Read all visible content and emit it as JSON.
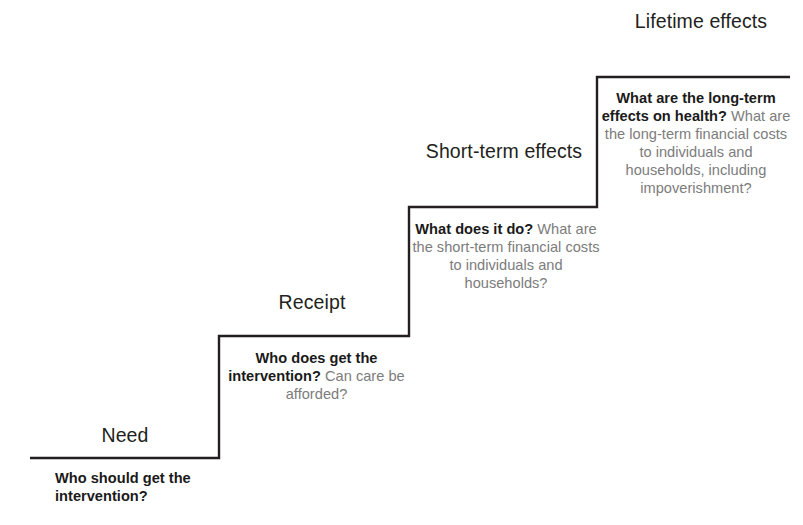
{
  "diagram": {
    "line_color": "#231f20",
    "primary_text_color": "#1a1a1a",
    "secondary_text_color": "#7c7c7c",
    "background_color": "#ffffff"
  },
  "steps": [
    {
      "id": "need",
      "heading": "Need",
      "primary_question": "Who should get the intervention?",
      "secondary_question": "",
      "align": "left"
    },
    {
      "id": "receipt",
      "heading": "Receipt",
      "primary_question": "Who does get the intervention?",
      "secondary_question": " Can care be afforded?",
      "align": "center"
    },
    {
      "id": "short_term",
      "heading": "Short-term effects",
      "primary_question": "What does it do?",
      "secondary_question": " What are the short-term financial costs to individuals and households?",
      "align": "center"
    },
    {
      "id": "lifetime",
      "heading": "Lifetime effects",
      "primary_question": "What are the long-term effects on health?",
      "secondary_question": " What are the long-term financial costs to individuals and households, including impoverishment?",
      "align": "center"
    }
  ],
  "geometry": {
    "points": "30,458 219,458 219,336 409,336 409,207 597,207 597,77 790,77",
    "stroke_width": 2.4
  }
}
